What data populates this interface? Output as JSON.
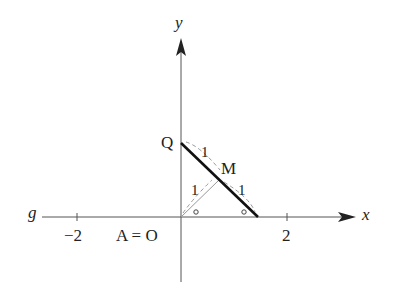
{
  "diagram": {
    "axes": {
      "x_label": "x",
      "y_label": "y",
      "line_label": "g"
    },
    "ticks": [
      {
        "value": -2,
        "label": "−2"
      },
      {
        "value": 2,
        "label": "2"
      }
    ],
    "points": {
      "origin": "A = O",
      "Q": "Q",
      "M": "M"
    },
    "segment_labels": {
      "QM": "1",
      "OM": "1",
      "M_to_xaxis": "1"
    },
    "angle_marks": [
      "∘",
      "∘"
    ],
    "colors": {
      "axis": "#555555",
      "segment": "#111111",
      "dashed": "#999999",
      "text": "#222222"
    }
  }
}
